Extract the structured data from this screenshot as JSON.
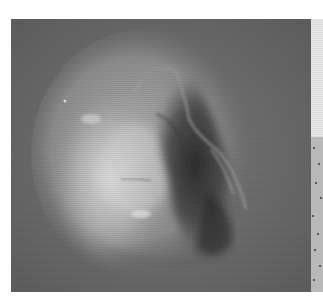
{
  "image": {
    "subject": "Grayscale orbital photograph of a mesa landform resembling a face",
    "alt": "Satellite image of a rounded mesa with bright left half and dark shadowed right half",
    "colors": {
      "background": "#6e6e6e",
      "highlight": "#d8d8d8",
      "shadow": "#2e2e2e",
      "strip_light": "#e3e3e3",
      "strip_texture": "#b9b9b9"
    }
  }
}
